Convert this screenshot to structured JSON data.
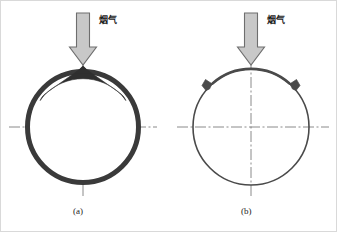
{
  "figure": {
    "background_color": "#ffffff",
    "panels": [
      {
        "id": "a",
        "caption": "(a)",
        "arrow_label": "烟气",
        "description": "tube cross-section with thick ash deposit layer, peaked at top",
        "center": {
          "x": 82,
          "y": 126
        },
        "radius": 58,
        "tube_outline_color": "#3a3a3a",
        "deposit_color": "#2f2f2f",
        "deposit_peak_height": 22,
        "ring_thickness": 5
      },
      {
        "id": "b",
        "caption": "(b)",
        "arrow_label": "烟气",
        "description": "clean tube cross-section with two small wedge-shaped ash tabs",
        "center": {
          "x": 250,
          "y": 126
        },
        "radius": 58,
        "tube_outline_color": "#4a4a4a",
        "deposit_color": "#4a4a4a",
        "ring_thickness": 1.6,
        "tab_angles_deg": [
          -132,
          -48
        ]
      }
    ],
    "arrow": {
      "fill_color": "#c8c8c8",
      "stroke_color": "#6e6e6e",
      "direction": "down",
      "shaft_width": 13,
      "head_width": 27
    },
    "centerline": {
      "color": "#7d7d7d",
      "style": "dash-dot",
      "width": 0.9
    }
  }
}
